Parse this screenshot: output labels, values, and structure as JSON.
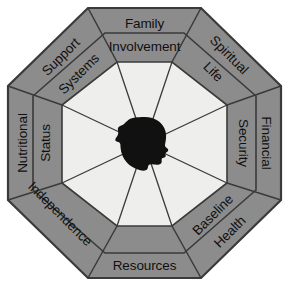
{
  "diagram": {
    "shape": "octagon",
    "segment_count": 8,
    "colors": {
      "background": "#ffffff",
      "outer_ring": "#8c8c8c",
      "inner_octagon": "#eeeeec",
      "stroke": "#3a3a3a",
      "center_figure": "#111111",
      "text": "#101010"
    },
    "center": {
      "icon_name": "head-silhouette-icon",
      "description": "black human head profile silhouette"
    },
    "segments": [
      {
        "position": "top",
        "outer": "Family",
        "inner": "Involvement",
        "rotation": 0
      },
      {
        "position": "top-right",
        "outer": "Spiritual",
        "inner": "Life",
        "rotation": 45
      },
      {
        "position": "right",
        "outer": "Financial",
        "inner": "Security",
        "rotation": 90
      },
      {
        "position": "bottom-right",
        "outer": "Baseline",
        "inner": "Health",
        "rotation": -45
      },
      {
        "position": "bottom",
        "outer": "Resources",
        "inner": "",
        "rotation": 0
      },
      {
        "position": "bottom-left",
        "outer": "Independence",
        "inner": "",
        "rotation": 45
      },
      {
        "position": "left",
        "outer": "Nutritional",
        "inner": "Status",
        "rotation": -90
      },
      {
        "position": "top-left",
        "outer": "Support",
        "inner": "Systems",
        "rotation": -45
      }
    ]
  }
}
